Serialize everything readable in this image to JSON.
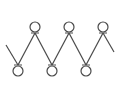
{
  "diagram": {
    "stroke_color": "#4a4a4a",
    "background": "#ffffff",
    "circle_radius": 5,
    "stroke_width": 1.2,
    "start_point": [
      6,
      45
    ],
    "end_point": [
      114,
      52
    ],
    "top_nodes": [
      {
        "id": "top-1",
        "cx": 35,
        "cy": 27
      },
      {
        "id": "top-2",
        "cx": 69,
        "cy": 27
      },
      {
        "id": "top-3",
        "cx": 103,
        "cy": 27
      }
    ],
    "bottom_nodes": [
      {
        "id": "bottom-1",
        "cx": 18,
        "cy": 71
      },
      {
        "id": "bottom-2",
        "cx": 52,
        "cy": 71
      },
      {
        "id": "bottom-3",
        "cx": 86,
        "cy": 71
      }
    ],
    "path_sequence": [
      "start",
      "bottom-1",
      "top-1",
      "bottom-2",
      "top-2",
      "bottom-3",
      "top-3",
      "end"
    ]
  }
}
